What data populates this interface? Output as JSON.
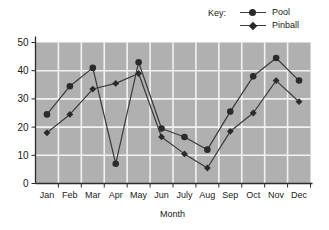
{
  "legend": {
    "key_label": "Key:",
    "entries": [
      {
        "name": "Pool",
        "marker": "circle-marker-icon",
        "color": "#2b2b2b"
      },
      {
        "name": "Pinball",
        "marker": "diamond-marker-icon",
        "color": "#2b2b2b"
      }
    ]
  },
  "axes": {
    "x_title": "Month",
    "y_title": "",
    "y_ticks": [
      "0",
      "10",
      "20",
      "30",
      "40",
      "50"
    ],
    "x_ticks": [
      "Jan",
      "Feb",
      "Mar",
      "Apr",
      "May",
      "Jun",
      "July",
      "Aug",
      "Sep",
      "Oct",
      "Nov",
      "Dec"
    ]
  },
  "style": {
    "plot_background": "#b0b0b0",
    "gridline_color": "#f2f2f2",
    "axis_color": "#2b2b2b",
    "series_line_color": "#3a3a3a",
    "marker_color": "#2b2b2b",
    "page_background": "#ffffff"
  },
  "chart_data": {
    "type": "line",
    "title": "",
    "xlabel": "Month",
    "ylabel": "",
    "categories": [
      "Jan",
      "Feb",
      "Mar",
      "Apr",
      "May",
      "Jun",
      "July",
      "Aug",
      "Sep",
      "Oct",
      "Nov",
      "Dec"
    ],
    "series": [
      {
        "name": "Pool",
        "marker": "circle",
        "values": [
          24.5,
          34.5,
          41,
          7,
          43,
          19.5,
          16.5,
          12,
          25.5,
          38,
          44.5,
          36.5
        ]
      },
      {
        "name": "Pinball",
        "marker": "diamond",
        "values": [
          18,
          24.5,
          33.5,
          35.5,
          39,
          16.5,
          10.5,
          5.5,
          18.5,
          25,
          36.5,
          29
        ]
      }
    ],
    "ylim": [
      0,
      50
    ],
    "ytick_step": 10,
    "grid": true,
    "legend_position": "top-right"
  }
}
